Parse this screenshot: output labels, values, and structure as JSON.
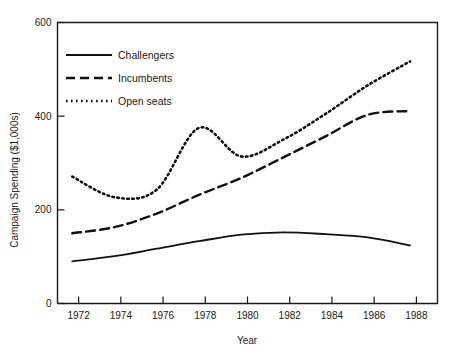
{
  "chart_data": {
    "type": "line",
    "title": "",
    "subtitle": "",
    "xlabel": "Year",
    "ylabel": "Campaign Spending ($1,000s)",
    "xlim": [
      1971,
      1989
    ],
    "ylim": [
      0,
      600
    ],
    "xticks": [
      1972,
      1974,
      1976,
      1978,
      1980,
      1982,
      1984,
      1986,
      1988
    ],
    "xtick_labels": [
      "1972",
      "1974",
      "1976",
      "1978",
      "1980",
      "1982",
      "1984",
      "1986",
      "1988"
    ],
    "yticks": [
      0,
      200,
      400,
      600
    ],
    "ytick_labels": [
      "0",
      "200",
      "400",
      "600"
    ],
    "grid": false,
    "legend_position": "upper-left",
    "x": [
      1971.7,
      1973.7,
      1975.7,
      1977.7,
      1979.7,
      1981.7,
      1983.7,
      1985.7,
      1987.7
    ],
    "series": [
      {
        "name": "Challengers",
        "style": "solid",
        "color": "#111111",
        "values": [
          90,
          101,
          117,
          133,
          147,
          152,
          148,
          141,
          124
        ]
      },
      {
        "name": "Incumbents",
        "style": "dashed",
        "color": "#111111",
        "values": [
          150,
          163,
          192,
          232,
          268,
          312,
          357,
          403,
          411
        ]
      },
      {
        "name": "Open seats",
        "style": "dotted",
        "color": "#111111",
        "values": [
          271,
          227,
          243,
          375,
          314,
          350,
          405,
          466,
          517
        ]
      }
    ],
    "annotations": []
  },
  "legend": {
    "items": [
      {
        "label": "Challengers",
        "style": "solid"
      },
      {
        "label": "Incumbents",
        "style": "dashed"
      },
      {
        "label": "Open seats",
        "style": "dotted"
      }
    ]
  }
}
